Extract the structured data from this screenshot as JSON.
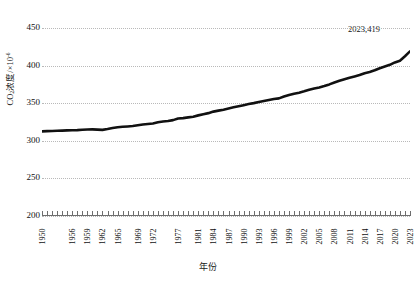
{
  "chart_data": {
    "type": "line",
    "title": "",
    "xlabel": "年份",
    "ylabel": "CO₂浓度/×10⁻⁶",
    "ylabel_parts": {
      "prefix": "CO",
      "sub": "2",
      "mid": "浓度/×10",
      "sup": "-6"
    },
    "xlim": [
      1950,
      2023
    ],
    "ylim": [
      200,
      450
    ],
    "ytick_values": [
      450,
      400,
      350,
      300,
      250,
      200
    ],
    "ytick_labels": [
      "450",
      "400",
      "350",
      "300",
      "250",
      "200"
    ],
    "grid": true,
    "legend": "none",
    "line_color": "#111111",
    "grid_color": "#b9b9b9",
    "xtick_labels": [
      "1950",
      "1956",
      "1959",
      "1962",
      "1965",
      "1969",
      "1972",
      "1977",
      "1981",
      "1984",
      "1987",
      "1990",
      "1993",
      "1996",
      "1999",
      "2002",
      "2005",
      "2008",
      "2011",
      "2014",
      "2017",
      "2020",
      "2023"
    ],
    "xtick_years": [
      1950,
      1956,
      1959,
      1962,
      1965,
      1969,
      1972,
      1977,
      1981,
      1984,
      1987,
      1990,
      1993,
      1996,
      1999,
      2002,
      2005,
      2008,
      2011,
      2014,
      2017,
      2020,
      2023
    ],
    "annotations": [
      {
        "text": "2023,419",
        "year": 2023,
        "value": 419
      }
    ],
    "x": [
      1950,
      1951,
      1952,
      1953,
      1954,
      1955,
      1956,
      1957,
      1958,
      1959,
      1960,
      1961,
      1962,
      1963,
      1964,
      1965,
      1966,
      1967,
      1968,
      1969,
      1970,
      1971,
      1972,
      1973,
      1974,
      1975,
      1976,
      1977,
      1978,
      1979,
      1980,
      1981,
      1982,
      1983,
      1984,
      1985,
      1986,
      1987,
      1988,
      1989,
      1990,
      1991,
      1992,
      1993,
      1994,
      1995,
      1996,
      1997,
      1998,
      1999,
      2000,
      2001,
      2002,
      2003,
      2004,
      2005,
      2006,
      2007,
      2008,
      2009,
      2010,
      2011,
      2012,
      2013,
      2014,
      2015,
      2016,
      2017,
      2018,
      2019,
      2020,
      2021,
      2022,
      2023
    ],
    "values": [
      312.5,
      312.8,
      313.0,
      313.3,
      313.5,
      313.8,
      314.0,
      314.2,
      314.6,
      315.0,
      315.2,
      314.8,
      314.5,
      315.6,
      316.9,
      318.0,
      318.7,
      319.1,
      319.6,
      320.6,
      321.6,
      322.4,
      323.1,
      324.6,
      325.7,
      326.3,
      327.5,
      329.7,
      330.2,
      331.1,
      332.0,
      333.8,
      335.4,
      336.8,
      338.8,
      340.1,
      341.4,
      343.1,
      344.7,
      346.0,
      347.4,
      348.9,
      350.1,
      351.5,
      352.9,
      354.2,
      355.6,
      356.4,
      358.9,
      360.9,
      362.6,
      364.0,
      365.8,
      367.8,
      369.5,
      371.0,
      372.9,
      375.0,
      377.5,
      379.8,
      381.9,
      383.8,
      385.6,
      387.4,
      389.9,
      391.6,
      393.8,
      396.5,
      398.7,
      401.0,
      404.2,
      406.5,
      412.5,
      419.0
    ],
    "series_name": "CO₂浓度"
  },
  "axis": {
    "y_title": "CO₂浓度/×10⁻⁶",
    "x_title": "年份"
  }
}
